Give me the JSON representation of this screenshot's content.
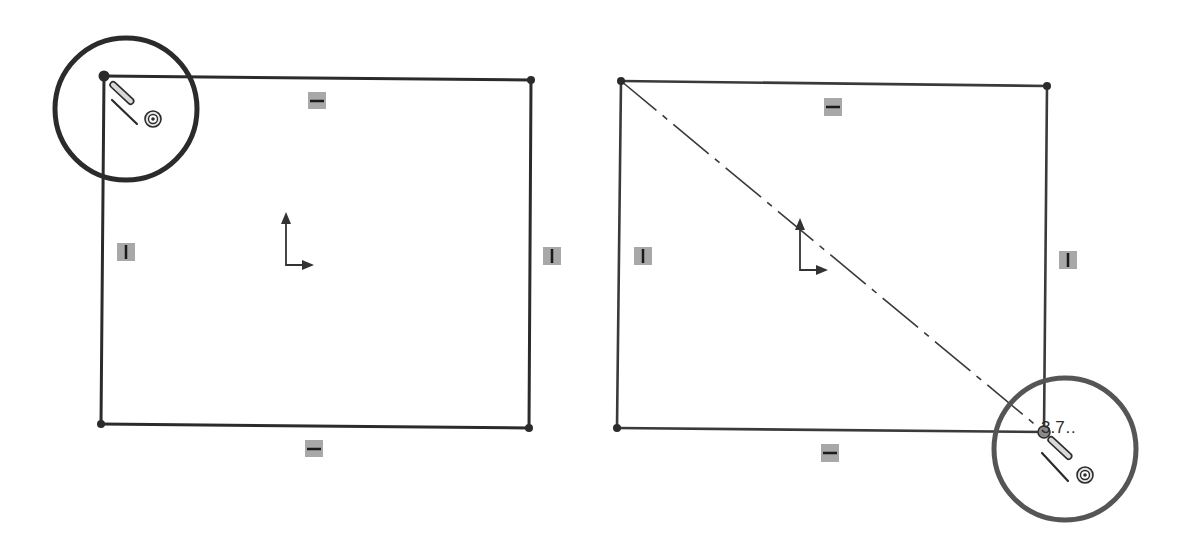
{
  "figure": {
    "colors": {
      "background": "#ffffff",
      "sketch_line": "#2b2b2b",
      "relation_badge": "#a8a8a8",
      "highlight_circle_left": "#2b2b2b",
      "highlight_circle_right": "#555555"
    }
  },
  "panels": [
    {
      "name": "left-panel",
      "rectangle": {
        "top_left": [
          104,
          76
        ],
        "top_right": [
          531,
          80
        ],
        "bottom_right": [
          529,
          428
        ],
        "bottom_left": [
          101,
          424
        ]
      },
      "relations": [
        {
          "type": "horizontal",
          "icon": "horizontal-relation-icon",
          "pos": [
            317,
            101
          ]
        },
        {
          "type": "horizontal",
          "icon": "horizontal-relation-icon",
          "pos": [
            314,
            449
          ]
        },
        {
          "type": "vertical",
          "icon": "vertical-relation-icon",
          "pos": [
            126,
            252
          ]
        },
        {
          "type": "vertical",
          "icon": "vertical-relation-icon",
          "pos": [
            552,
            256
          ]
        }
      ],
      "origin": [
        286,
        265
      ],
      "highlight": {
        "center": [
          120,
          110
        ],
        "radius": 77,
        "target": "start-corner"
      },
      "cursor": "rectangle-sketch-cursor"
    },
    {
      "name": "right-panel",
      "rectangle": {
        "top_left": [
          621,
          81
        ],
        "top_right": [
          1047,
          86
        ],
        "bottom_right": [
          1044,
          432
        ],
        "bottom_left": [
          617,
          428
        ]
      },
      "centerline": {
        "from": [
          621,
          81
        ],
        "to": [
          1044,
          432
        ],
        "style": "dash-dot"
      },
      "relations": [
        {
          "type": "horizontal",
          "icon": "horizontal-relation-icon",
          "pos": [
            833,
            107
          ]
        },
        {
          "type": "horizontal",
          "icon": "horizontal-relation-icon",
          "pos": [
            830,
            453
          ]
        },
        {
          "type": "vertical",
          "icon": "vertical-relation-icon",
          "pos": [
            643,
            256
          ]
        },
        {
          "type": "vertical",
          "icon": "vertical-relation-icon",
          "pos": [
            1068,
            260
          ]
        }
      ],
      "origin": [
        800,
        270
      ],
      "highlight": {
        "center": [
          1065,
          449
        ],
        "radius": 73,
        "target": "end-corner"
      },
      "cursor": "rectangle-sketch-cursor",
      "dimension_text": "3.7…"
    }
  ],
  "labels": {
    "dimension_readout": "3.7…"
  }
}
